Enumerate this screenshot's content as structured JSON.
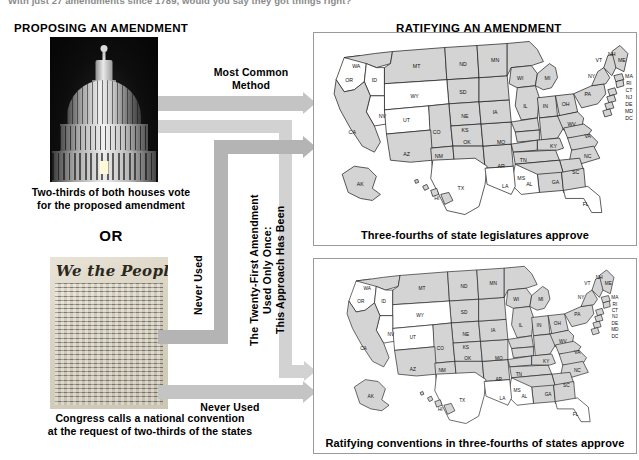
{
  "intro_text": "With just 27 amendments since 1789, would you say they got things right?",
  "columns": {
    "propose_heading": "PROPOSING AN AMENDMENT",
    "ratify_heading": "RATIFYING AN AMENDMENT"
  },
  "propose": {
    "capitol_photo_alt": "capitol-dome-photo",
    "capitol_caption_line1": "Two-thirds of both houses vote",
    "capitol_caption_line2": "for the proposed amendment",
    "or_label": "OR",
    "constitution_photo_alt": "constitution-preamble-photo",
    "constitution_title": "We the People",
    "constitution_caption_line1": "Congress calls a national convention",
    "constitution_caption_line2": "at the request of two-thirds of the states"
  },
  "arrows": [
    {
      "id": "arrow-most-common",
      "label": "Most Common\nMethod",
      "label_line1": "Most Common",
      "label_line2": "Method",
      "orientation": "horizontal"
    },
    {
      "id": "arrow-twenty-first",
      "label": "This Approach Has Been\nUsed Only Once:\nThe Twenty-First Amendment",
      "label_line1": "This Approach Has Been",
      "label_line2": "Used Only Once:",
      "label_line3": "The Twenty-First Amendment",
      "orientation": "vertical"
    },
    {
      "id": "arrow-never-used-convention",
      "label": "Never Used",
      "orientation": "vertical"
    },
    {
      "id": "arrow-never-used-bottom",
      "label": "Never Used",
      "orientation": "horizontal"
    }
  ],
  "maps": [
    {
      "id": "map-state-legislatures",
      "caption": "Three-fourths of state legislatures approve",
      "shaded_fill": "#d4d4d4",
      "unshaded_fill": "#ffffff",
      "shaded_states": [
        "WA",
        "MT",
        "ND",
        "SD",
        "NE",
        "KS",
        "OK",
        "AZ",
        "NM",
        "CA",
        "MN",
        "WI",
        "MI",
        "IA",
        "IL",
        "IN",
        "OH",
        "PA",
        "NY",
        "VT",
        "NH",
        "ME",
        "MA",
        "RI",
        "CT",
        "NJ",
        "DE",
        "MD",
        "DC",
        "WV",
        "VA",
        "NC",
        "SC",
        "GA",
        "AL",
        "TN",
        "AR",
        "MO",
        "KY",
        "AK",
        "HI"
      ],
      "unshaded_states": [
        "OR",
        "ID",
        "NV",
        "UT",
        "WY",
        "CO",
        "TX",
        "LA",
        "MS",
        "FL"
      ],
      "labels": [
        "WA",
        "OR",
        "ID",
        "MT",
        "ND",
        "SD",
        "WY",
        "NE",
        "IA",
        "MN",
        "WI",
        "MI",
        "IL",
        "IN",
        "OH",
        "PA",
        "NY",
        "VT",
        "NH",
        "ME",
        "MA",
        "RI",
        "CT",
        "NJ",
        "DE",
        "MD",
        "DC",
        "WV",
        "VA",
        "NC",
        "SC",
        "GA",
        "AL",
        "FL",
        "TN",
        "KY",
        "MO",
        "AR",
        "LA",
        "MS",
        "TX",
        "OK",
        "KS",
        "CO",
        "NM",
        "AZ",
        "UT",
        "NV",
        "CA",
        "AK",
        "HI"
      ]
    },
    {
      "id": "map-ratifying-conventions",
      "caption": "Ratifying conventions in three-fourths of states approve",
      "shaded_fill": "#d4d4d4",
      "unshaded_fill": "#ffffff",
      "shaded_states": [
        "WA",
        "MT",
        "ND",
        "SD",
        "NE",
        "KS",
        "OK",
        "AZ",
        "NM",
        "CA",
        "MN",
        "WI",
        "MI",
        "IA",
        "IL",
        "IN",
        "OH",
        "PA",
        "NY",
        "VT",
        "NH",
        "ME",
        "MA",
        "RI",
        "CT",
        "NJ",
        "DE",
        "MD",
        "DC",
        "WV",
        "VA",
        "NC",
        "SC",
        "GA",
        "AL",
        "TN",
        "AR",
        "MO",
        "KY",
        "AK",
        "HI"
      ],
      "unshaded_states": [
        "OR",
        "ID",
        "NV",
        "UT",
        "WY",
        "CO",
        "TX",
        "LA",
        "MS",
        "FL"
      ],
      "labels": [
        "WA",
        "OR",
        "ID",
        "MT",
        "ND",
        "SD",
        "WY",
        "NE",
        "IA",
        "MN",
        "WI",
        "MI",
        "IL",
        "IN",
        "OH",
        "PA",
        "NY",
        "VT",
        "NH",
        "ME",
        "MA",
        "RI",
        "CT",
        "NJ",
        "DE",
        "MD",
        "DC",
        "WV",
        "VA",
        "NC",
        "SC",
        "GA",
        "AL",
        "FL",
        "TN",
        "KY",
        "MO",
        "AR",
        "LA",
        "MS",
        "TX",
        "OK",
        "KS",
        "CO",
        "NM",
        "AZ",
        "UT",
        "NV",
        "CA",
        "AK",
        "HI"
      ]
    }
  ],
  "colors": {
    "arrow_gray": "#c4c4c4",
    "arrow_light_gray": "#d2d2d2",
    "map_shaded": "#d4d4d4",
    "panel_border": "#9b9b9b",
    "text": "#000000"
  }
}
